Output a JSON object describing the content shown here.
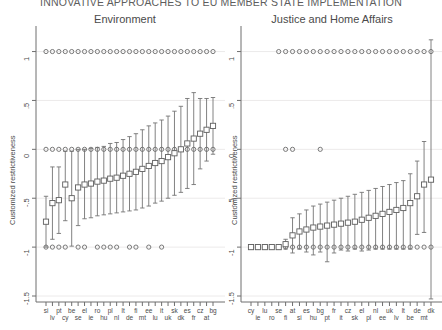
{
  "document": {
    "header_title": "INNOVATIVE APPROACHES TO EU MEMBER STATE IMPLEMENTATION"
  },
  "axes": {
    "ylabel": "Customized restrictiveness",
    "ytick_labels": [
      "1",
      ".5",
      "0",
      "-.5",
      "-1",
      "-1.5"
    ],
    "ytick_values": [
      1,
      0.5,
      0,
      -0.5,
      -1,
      -1.5
    ],
    "ylim": [
      -1.5,
      1.2
    ]
  },
  "chart_data": [
    {
      "type": "scatter",
      "title": "Environment",
      "xlabel": "",
      "ylabel": "Customized restrictiveness",
      "ylim": [
        -1.5,
        1.2
      ],
      "grid": true,
      "legend": "none",
      "categories": [
        "si",
        "lv",
        "pt",
        "cy",
        "be",
        "se",
        "el",
        "ie",
        "ro",
        "hu",
        "pl",
        "nl",
        "lt",
        "de",
        "fi",
        "mt",
        "ee",
        "lu",
        "it",
        "uk",
        "sk",
        "dk",
        "es",
        "fr",
        "cz",
        "at",
        "bg"
      ],
      "xtick_labels_row1": [
        "si",
        "pt",
        "be",
        "el",
        "ro",
        "pl",
        "lt",
        "fi",
        "ee",
        "it",
        "sk",
        "es",
        "cz",
        "bg"
      ],
      "xtick_labels_row2": [
        "lv",
        "cy",
        "se",
        "ie",
        "hu",
        "nl",
        "de",
        "mt",
        "lu",
        "uk",
        "dk",
        "fr",
        "at"
      ],
      "series": [
        {
          "name": "customized restrictiveness estimate",
          "marker": "square",
          "values": [
            -0.74,
            -0.55,
            -0.52,
            -0.36,
            -0.5,
            -0.39,
            -0.36,
            -0.35,
            -0.33,
            -0.32,
            -0.3,
            -0.29,
            -0.27,
            -0.25,
            -0.23,
            -0.2,
            -0.17,
            -0.14,
            -0.12,
            -0.08,
            -0.04,
            0.0,
            0.06,
            0.11,
            0.16,
            0.2,
            0.24
          ],
          "ci_low": [
            -1.0,
            -0.92,
            -0.86,
            -0.73,
            -0.99,
            -0.78,
            -0.71,
            -0.7,
            -0.68,
            -0.67,
            -0.66,
            -0.65,
            -0.64,
            -0.63,
            -0.62,
            -0.6,
            -0.58,
            -0.55,
            -0.53,
            -0.5,
            -0.47,
            -0.44,
            -0.4,
            -0.36,
            -0.2,
            -0.12,
            -0.05
          ],
          "ci_high": [
            -0.48,
            -0.18,
            -0.18,
            -0.02,
            -0.02,
            0.0,
            0.0,
            0.01,
            0.02,
            0.03,
            0.06,
            0.07,
            0.1,
            0.13,
            0.16,
            0.2,
            0.24,
            0.27,
            0.3,
            0.34,
            0.39,
            0.44,
            0.52,
            0.58,
            0.52,
            0.52,
            0.53
          ]
        },
        {
          "name": "upper bound marker (+1)",
          "marker": "circle",
          "values": [
            1,
            1,
            1,
            1,
            1,
            1,
            1,
            1,
            1,
            1,
            1,
            1,
            1,
            1,
            1,
            1,
            1,
            1,
            1,
            1,
            1,
            1,
            1,
            1,
            1,
            1,
            1
          ]
        },
        {
          "name": "lower bound marker (0)",
          "marker": "circle",
          "values": [
            0,
            0,
            0,
            0,
            0,
            0,
            0,
            0,
            0,
            0,
            0,
            0,
            0,
            0,
            0,
            0,
            0,
            0,
            0,
            0,
            0,
            0,
            0,
            0,
            0,
            0,
            0
          ]
        },
        {
          "name": "floor marker (-1)",
          "marker": "circle",
          "values": [
            -1,
            -1,
            -1,
            -1,
            null,
            -1,
            -1,
            null,
            -1,
            -1,
            -1,
            -1,
            null,
            -1,
            -1,
            null,
            -1,
            null,
            -1,
            null,
            null,
            null,
            null,
            null,
            null,
            null,
            null
          ]
        }
      ]
    },
    {
      "type": "scatter",
      "title": "Justice and Home Affairs",
      "xlabel": "",
      "ylabel": "Customized restrictiveness",
      "ylim": [
        -1.5,
        1.2
      ],
      "grid": true,
      "legend": "none",
      "categories": [
        "cy",
        "ie",
        "lu",
        "ro",
        "se",
        "fi",
        "at",
        "si",
        "es",
        "hu",
        "bg",
        "pt",
        "fr",
        "it",
        "cz",
        "sk",
        "el",
        "pl",
        "nl",
        "ee",
        "uk",
        "lv",
        "lt",
        "be",
        "de",
        "mt",
        "dk"
      ],
      "xtick_labels_row1": [
        "cy",
        "lu",
        "se",
        "at",
        "es",
        "bg",
        "fr",
        "cz",
        "el",
        "nl",
        "uk",
        "lt",
        "de",
        "dk"
      ],
      "xtick_labels_row2": [
        "ie",
        "ro",
        "fi",
        "si",
        "hu",
        "pt",
        "it",
        "sk",
        "pl",
        "ee",
        "lv",
        "be",
        "mt"
      ],
      "series": [
        {
          "name": "customized restrictiveness estimate",
          "marker": "square",
          "values": [
            -1.0,
            -1.0,
            -1.0,
            -1.0,
            -1.0,
            -0.97,
            -0.88,
            -0.84,
            -0.82,
            -0.8,
            -0.79,
            -0.78,
            -0.77,
            -0.76,
            -0.75,
            -0.74,
            -0.72,
            -0.7,
            -0.68,
            -0.66,
            -0.64,
            -0.62,
            -0.6,
            -0.55,
            -0.48,
            -0.36,
            -0.31
          ],
          "ci_low": [
            -1.02,
            -1.02,
            -1.02,
            -1.02,
            -1.02,
            -1.02,
            -1.06,
            -1.02,
            -1.05,
            -1.08,
            -1.05,
            -1.15,
            -1.06,
            -1.03,
            -1.04,
            -1.02,
            -1.04,
            -1.03,
            -1.02,
            -1.02,
            -1.02,
            -1.02,
            -1.02,
            -1.02,
            -0.87,
            -0.85,
            -1.53
          ],
          "ci_high": [
            -0.98,
            -0.98,
            -0.98,
            -0.98,
            -0.98,
            -0.92,
            -0.7,
            -0.66,
            -0.62,
            -0.58,
            -0.56,
            -0.54,
            -0.52,
            -0.5,
            -0.48,
            -0.46,
            -0.44,
            -0.42,
            -0.4,
            -0.38,
            -0.36,
            -0.34,
            -0.32,
            -0.25,
            -0.12,
            0.08,
            1.12
          ]
        },
        {
          "name": "upper bound marker (+1)",
          "marker": "circle",
          "values": [
            null,
            null,
            null,
            null,
            1,
            1,
            1,
            1,
            1,
            1,
            1,
            1,
            1,
            1,
            1,
            1,
            1,
            1,
            1,
            1,
            1,
            1,
            1,
            1,
            1,
            1,
            1
          ]
        },
        {
          "name": "mid marker (0)",
          "marker": "circle",
          "values": [
            null,
            null,
            null,
            null,
            null,
            0,
            0,
            null,
            null,
            null,
            0,
            null,
            null,
            null,
            null,
            null,
            null,
            null,
            null,
            null,
            null,
            null,
            null,
            null,
            null,
            null,
            null
          ]
        },
        {
          "name": "floor marker (-1)",
          "marker": "circle",
          "values": [
            -1,
            -1,
            -1,
            -1,
            -1,
            -1,
            -1,
            -1,
            -1,
            -1,
            -1,
            -1,
            -1,
            -1,
            -1,
            -1,
            -1,
            -1,
            -1,
            -1,
            -1,
            -1,
            -1,
            -1,
            -1,
            -1,
            -1
          ]
        }
      ]
    }
  ]
}
